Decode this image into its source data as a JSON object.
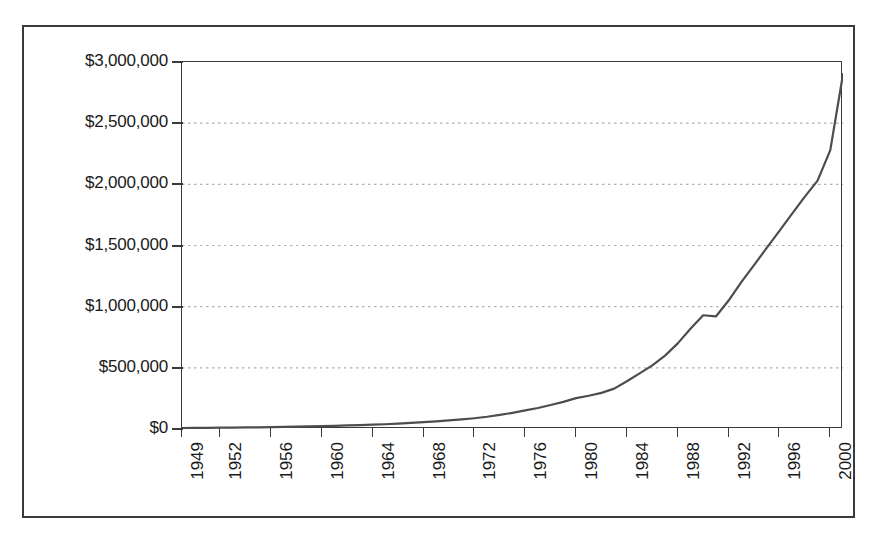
{
  "chart_data": {
    "type": "line",
    "title": "",
    "subtitle": "",
    "xlabel": "",
    "ylabel": "",
    "xlim": [
      1949,
      2001
    ],
    "ylim": [
      0,
      3000000
    ],
    "grid": true,
    "grid_axis": "y",
    "legend": false,
    "legend_position": "none",
    "line_color": "#4d4d4d",
    "grid_color": "#b0b0b0",
    "axis_color": "#3a3a3a",
    "background_color": "#ffffff",
    "y_ticks": [
      0,
      500000,
      1000000,
      1500000,
      2000000,
      2500000,
      3000000
    ],
    "y_tick_labels": [
      "$0",
      "$500,000",
      "$1,000,000",
      "$1,500,000",
      "$2,000,000",
      "$2,500,000",
      "$3,000,000"
    ],
    "x_ticks": [
      1949,
      1952,
      1956,
      1960,
      1964,
      1968,
      1972,
      1976,
      1980,
      1984,
      1988,
      1992,
      1996,
      2000
    ],
    "x_tick_labels": [
      "1949",
      "1952",
      "1956",
      "1960",
      "1964",
      "1968",
      "1972",
      "1976",
      "1980",
      "1984",
      "1988",
      "1992",
      "1996",
      "2000"
    ],
    "x": [
      1949,
      1950,
      1951,
      1952,
      1953,
      1954,
      1955,
      1956,
      1957,
      1958,
      1959,
      1960,
      1961,
      1962,
      1963,
      1964,
      1965,
      1966,
      1967,
      1968,
      1969,
      1970,
      1971,
      1972,
      1973,
      1974,
      1975,
      1976,
      1977,
      1978,
      1979,
      1980,
      1981,
      1982,
      1983,
      1984,
      1985,
      1986,
      1987,
      1988,
      1989,
      1990,
      1991,
      1992,
      1993,
      1994,
      1995,
      1996,
      1997,
      1998,
      1999,
      2000,
      2001
    ],
    "values": [
      8000,
      9000,
      10000,
      11000,
      12000,
      13000,
      14000,
      15000,
      17000,
      19000,
      21000,
      24000,
      26000,
      29000,
      32000,
      35000,
      39000,
      44000,
      50000,
      57000,
      63000,
      70000,
      78000,
      88000,
      100000,
      115000,
      132000,
      152000,
      172000,
      196000,
      222000,
      252000,
      272000,
      295000,
      330000,
      390000,
      455000,
      520000,
      600000,
      700000,
      820000,
      930000,
      920000,
      1050000,
      1200000,
      1340000,
      1480000,
      1620000,
      1760000,
      1900000,
      2030000,
      2280000,
      2900000
    ],
    "series_name": "Total",
    "annotations": []
  }
}
